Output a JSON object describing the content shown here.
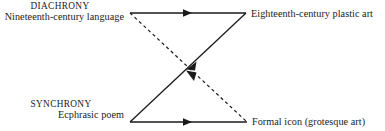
{
  "figure": {
    "kind": "bowtie-relation-diagram",
    "background_color": "#ffffff",
    "line_color": "#1a1a1a",
    "text_color": "#1a1a1a"
  },
  "nodes": {
    "top_left": {
      "axis_term": "DIACHRONY",
      "label": "Nineteenth-century language"
    },
    "top_right": {
      "axis_term": "",
      "label": "Eighteenth-century plastic art"
    },
    "bottom_left": {
      "axis_term": "SYNCHRONY",
      "label": "Ecphrasic poem"
    },
    "bottom_right": {
      "axis_term": "",
      "label": "Formal icon (grotesque art)"
    }
  },
  "edges": [
    {
      "id": "top-horizontal",
      "from": "top_left",
      "to": "top_right",
      "style": "solid",
      "arrow": "mid-right"
    },
    {
      "id": "bottom-horizontal",
      "from": "bottom_left",
      "to": "bottom_right",
      "style": "solid",
      "arrow": "mid-right"
    },
    {
      "id": "rising-diagonal",
      "from": "bottom_left",
      "to": "top_right",
      "style": "solid",
      "arrow": "mid-toward-center"
    },
    {
      "id": "falling-diagonal",
      "from": "top_left",
      "to": "bottom_right",
      "style": "dashed",
      "arrow": "mid-toward-center"
    }
  ]
}
